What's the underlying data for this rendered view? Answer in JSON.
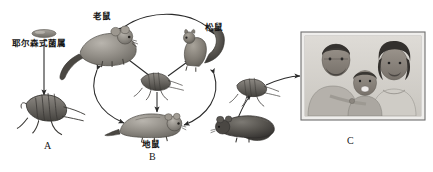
{
  "figure": {
    "background_color": "#ffffff",
    "ink_color": "#2a2a2a"
  },
  "labels": {
    "bacteria": "耶尔森式菌属",
    "rat": "老鼠",
    "squirrel": "松鼠",
    "gopher": "地鼠",
    "item_a": "A",
    "item_b": "B",
    "item_c": "C"
  },
  "nodes": [
    {
      "id": "bacteria",
      "name": "yersinia-bacteria",
      "label": "耶尔森式菌属",
      "x": 42,
      "y": 33,
      "kind": "bacterium"
    },
    {
      "id": "flea_a",
      "name": "flea-a",
      "label": "A",
      "x": 48,
      "y": 108,
      "kind": "flea"
    },
    {
      "id": "rat",
      "name": "rat",
      "label": "老鼠",
      "x": 105,
      "y": 45,
      "kind": "rodent"
    },
    {
      "id": "squirrel",
      "name": "squirrel",
      "label": "松鼠",
      "x": 198,
      "y": 50,
      "kind": "rodent"
    },
    {
      "id": "flea_mid",
      "name": "flea-middle",
      "label": "",
      "x": 157,
      "y": 83,
      "kind": "flea"
    },
    {
      "id": "gopher",
      "name": "gopher",
      "label": "地鼠",
      "x": 150,
      "y": 123,
      "kind": "rodent"
    },
    {
      "id": "flea_r",
      "name": "flea-right",
      "label": "",
      "x": 253,
      "y": 88,
      "kind": "flea"
    },
    {
      "id": "rat_r",
      "name": "rat-right",
      "label": "",
      "x": 245,
      "y": 125,
      "kind": "rodent"
    },
    {
      "id": "humans",
      "name": "human-family-photo",
      "label": "C",
      "x": 363,
      "y": 78,
      "kind": "photo"
    }
  ],
  "edges": [
    {
      "from": "bacteria",
      "to": "flea_a",
      "style": "straight",
      "heads": "single"
    },
    {
      "from": "flea_mid",
      "to": "rat",
      "style": "straight",
      "heads": "single"
    },
    {
      "from": "flea_mid",
      "to": "squirrel",
      "style": "straight",
      "heads": "single"
    },
    {
      "from": "flea_mid",
      "to": "gopher",
      "style": "straight",
      "heads": "single"
    },
    {
      "from": "rat",
      "to": "squirrel",
      "style": "arc",
      "heads": "double"
    },
    {
      "from": "rat",
      "to": "gopher",
      "style": "arc",
      "heads": "double"
    },
    {
      "from": "squirrel",
      "to": "gopher",
      "style": "arc",
      "heads": "double"
    },
    {
      "from": "rat_r",
      "to": "flea_r",
      "style": "arc",
      "heads": "single"
    },
    {
      "from": "flea_r",
      "to": "humans",
      "style": "arc",
      "heads": "single"
    }
  ],
  "photo": {
    "name": "family-photograph",
    "caption": "C",
    "frame_color": "#6e6e6e",
    "subjects": [
      "adult-man",
      "child",
      "adult-woman"
    ]
  }
}
